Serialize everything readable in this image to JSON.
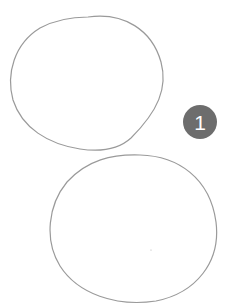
{
  "figure": {
    "badge": {
      "label": "1",
      "color": "#6d6d6d"
    },
    "shapes": [
      {
        "name": "upper-circle",
        "stroke": "#9a9a9a"
      },
      {
        "name": "lower-circle",
        "stroke": "#9a9a9a"
      }
    ]
  }
}
